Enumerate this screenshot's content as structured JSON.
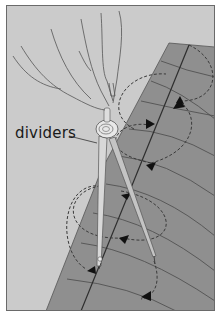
{
  "illustration": {
    "label": "dividers",
    "subject": "hand holding dividers walking along a line on fabric",
    "colors": {
      "background": "#cbcbcb",
      "fabric": "#8f8f8f",
      "line": "#3a3a3a",
      "border": "#6a6a6a",
      "metal_light": "#e6e6e6",
      "metal_dark": "#8a8a8a"
    }
  }
}
